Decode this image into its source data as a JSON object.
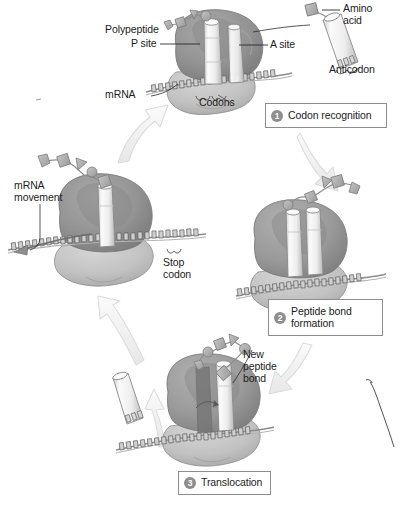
{
  "figure": {
    "palette": {
      "ink": "#1c1c1c",
      "large_subunit": "#8f8f8f",
      "large_subunit_dark": "#6e6e6e",
      "small_subunit": "#bdbdbd",
      "trna": "#f1f1f1",
      "trna_outline": "#808080",
      "amino_acid": "#a8a8a8",
      "mrna": "#9a9a9a",
      "arrow_fill": "#f2f2f2",
      "arrow_stroke": "#d2d2d2",
      "box_border": "#8d8d8d",
      "badge": "#8e8e8e",
      "background": "#ffffff"
    }
  },
  "labels": {
    "polypeptide": "Polypeptide",
    "p_site": "P site",
    "a_site": "A site",
    "mrna": "mRNA",
    "codons": "Codons",
    "amino_acid": "Amino\nacid",
    "anticodon": "Anticodon",
    "mrna_movement": "mRNA\nmovement",
    "stop_codon": "Stop\ncodon",
    "new_peptide_bond": "New\npeptide\nbond"
  },
  "steps": [
    {
      "number": "1",
      "label": "Codon recognition"
    },
    {
      "number": "2",
      "label": "Peptide bond\nformation"
    },
    {
      "number": "3",
      "label": "Translocation"
    }
  ]
}
